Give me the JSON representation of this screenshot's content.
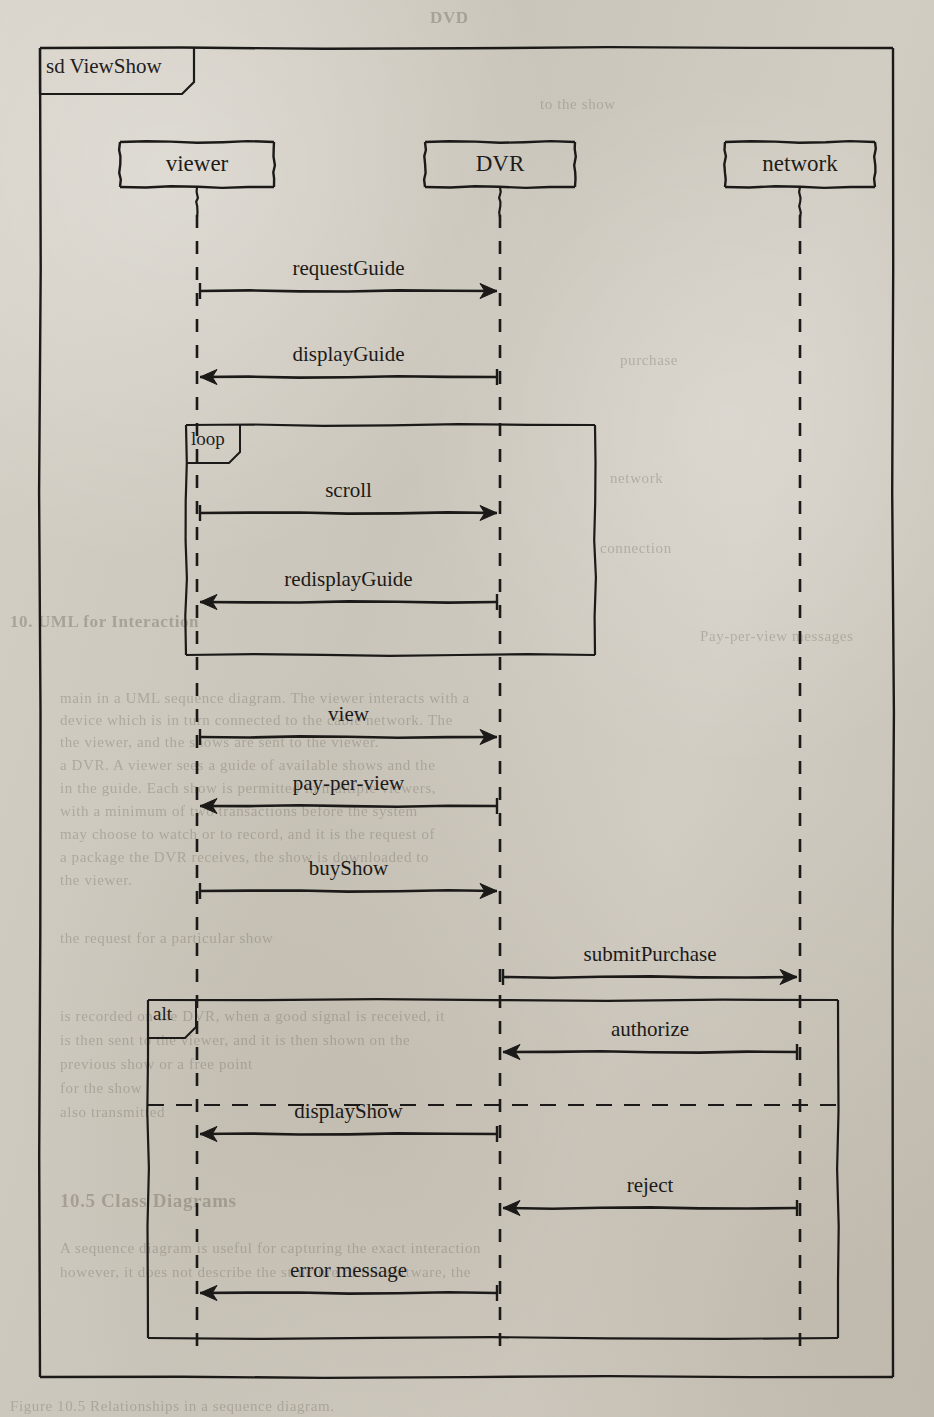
{
  "diagram": {
    "kind": "uml-sequence-diagram",
    "frame_keyword": "sd",
    "frame_name": "ViewShow",
    "frame_label": "sd ViewShow",
    "ink_color": "#1c1a18",
    "paper_color": "#cdc8bd"
  },
  "lifelines": [
    {
      "id": "viewer",
      "label": "viewer",
      "x": 197
    },
    {
      "id": "dvr",
      "label": "DVR",
      "x": 500
    },
    {
      "id": "network",
      "label": "network",
      "x": 800
    }
  ],
  "messages": [
    {
      "label": "requestGuide",
      "from": "viewer",
      "to": "dvr",
      "direction": "right",
      "y": 291
    },
    {
      "label": "displayGuide",
      "from": "dvr",
      "to": "viewer",
      "direction": "left",
      "y": 377
    },
    {
      "label": "scroll",
      "from": "viewer",
      "to": "dvr",
      "direction": "right",
      "y": 513
    },
    {
      "label": "redisplayGuide",
      "from": "dvr",
      "to": "viewer",
      "direction": "left",
      "y": 602
    },
    {
      "label": "view",
      "from": "viewer",
      "to": "dvr",
      "direction": "right",
      "y": 737
    },
    {
      "label": "pay-per-view",
      "from": "dvr",
      "to": "viewer",
      "direction": "left",
      "y": 806
    },
    {
      "label": "buyShow",
      "from": "viewer",
      "to": "dvr",
      "direction": "right",
      "y": 891
    },
    {
      "label": "submitPurchase",
      "from": "dvr",
      "to": "network",
      "direction": "right",
      "y": 977
    },
    {
      "label": "authorize",
      "from": "network",
      "to": "dvr",
      "direction": "left",
      "y": 1052
    },
    {
      "label": "displayShow",
      "from": "dvr",
      "to": "viewer",
      "direction": "left",
      "y": 1134
    },
    {
      "label": "reject",
      "from": "network",
      "to": "dvr",
      "direction": "left",
      "y": 1208
    },
    {
      "label": "error message",
      "from": "dvr",
      "to": "viewer",
      "direction": "left",
      "y": 1293
    }
  ],
  "fragments": [
    {
      "id": "loop-fragment",
      "operator": "loop",
      "x": 186,
      "y": 425,
      "width": 409,
      "height": 230,
      "tab_width": 54,
      "tab_height": 27,
      "dividers": []
    },
    {
      "id": "alt-fragment",
      "operator": "alt",
      "x": 148,
      "y": 1000,
      "width": 690,
      "height": 338,
      "tab_width": 48,
      "tab_height": 27,
      "dividers": [
        1105
      ]
    }
  ],
  "outer_frame": {
    "x": 40,
    "y": 48,
    "width": 853,
    "height": 1329,
    "tab_width": 154,
    "tab_height": 34
  },
  "actor_boxes": [
    {
      "id": "viewer",
      "x": 120,
      "y": 142,
      "width": 154,
      "height": 45
    },
    {
      "id": "dvr",
      "x": 425,
      "y": 142,
      "width": 150,
      "height": 45
    },
    {
      "id": "network",
      "x": 725,
      "y": 142,
      "width": 150,
      "height": 45
    }
  ],
  "page_bleed": [
    {
      "text": "DVD",
      "x": 430,
      "y": 8,
      "size": 17,
      "bold": true
    },
    {
      "text": "to the show",
      "x": 540,
      "y": 96,
      "size": 15,
      "bold": false
    },
    {
      "text": "purchase",
      "x": 620,
      "y": 352,
      "size": 15,
      "bold": false
    },
    {
      "text": "network",
      "x": 610,
      "y": 470,
      "size": 15,
      "bold": false
    },
    {
      "text": "connection",
      "x": 600,
      "y": 540,
      "size": 15,
      "bold": false
    },
    {
      "text": "10. UML for Interaction",
      "x": 10,
      "y": 612,
      "size": 17,
      "bold": true
    },
    {
      "text": "Pay-per-view messages",
      "x": 700,
      "y": 628,
      "size": 15,
      "bold": false
    },
    {
      "text": "main in a UML sequence diagram. The  viewer  interacts with a",
      "x": 60,
      "y": 690,
      "size": 15,
      "bold": false
    },
    {
      "text": "device which is in turn connected to the cable network. The",
      "x": 60,
      "y": 712,
      "size": 15,
      "bold": false
    },
    {
      "text": "the viewer, and the shows are sent to the viewer.",
      "x": 60,
      "y": 734,
      "size": 15,
      "bold": false
    },
    {
      "text": "a DVR. A viewer sees a guide of available shows and the",
      "x": 60,
      "y": 757,
      "size": 15,
      "bold": false
    },
    {
      "text": "in the guide. Each show is permitted in multiple viewers,",
      "x": 60,
      "y": 780,
      "size": 15,
      "bold": false
    },
    {
      "text": "with a minimum of two transactions before the system",
      "x": 60,
      "y": 803,
      "size": 15,
      "bold": false
    },
    {
      "text": "may choose to watch or to record, and it is the request of",
      "x": 60,
      "y": 826,
      "size": 15,
      "bold": false
    },
    {
      "text": "a package the DVR receives, the show is downloaded to",
      "x": 60,
      "y": 849,
      "size": 15,
      "bold": false
    },
    {
      "text": "the viewer.",
      "x": 60,
      "y": 872,
      "size": 15,
      "bold": false
    },
    {
      "text": "the request for a particular show",
      "x": 60,
      "y": 930,
      "size": 15,
      "bold": false
    },
    {
      "text": "is recorded on the DVR, when a good signal is received, it",
      "x": 60,
      "y": 1008,
      "size": 15,
      "bold": false
    },
    {
      "text": "is then sent to the viewer, and it is then shown on the",
      "x": 60,
      "y": 1032,
      "size": 15,
      "bold": false
    },
    {
      "text": "previous show or a free point",
      "x": 60,
      "y": 1056,
      "size": 15,
      "bold": false
    },
    {
      "text": "for the show",
      "x": 60,
      "y": 1080,
      "size": 15,
      "bold": false
    },
    {
      "text": "also transmitted",
      "x": 60,
      "y": 1104,
      "size": 15,
      "bold": false
    },
    {
      "text": "10.5  Class Diagrams",
      "x": 60,
      "y": 1190,
      "size": 19,
      "bold": true
    },
    {
      "text": "A sequence diagram is useful for capturing the exact interaction",
      "x": 60,
      "y": 1240,
      "size": 15,
      "bold": false
    },
    {
      "text": "however, it does not describe the structure of the software, the",
      "x": 60,
      "y": 1264,
      "size": 15,
      "bold": false
    },
    {
      "text": "Figure 10.5  Relationships in a sequence diagram.",
      "x": 10,
      "y": 1398,
      "size": 15,
      "bold": false
    }
  ]
}
